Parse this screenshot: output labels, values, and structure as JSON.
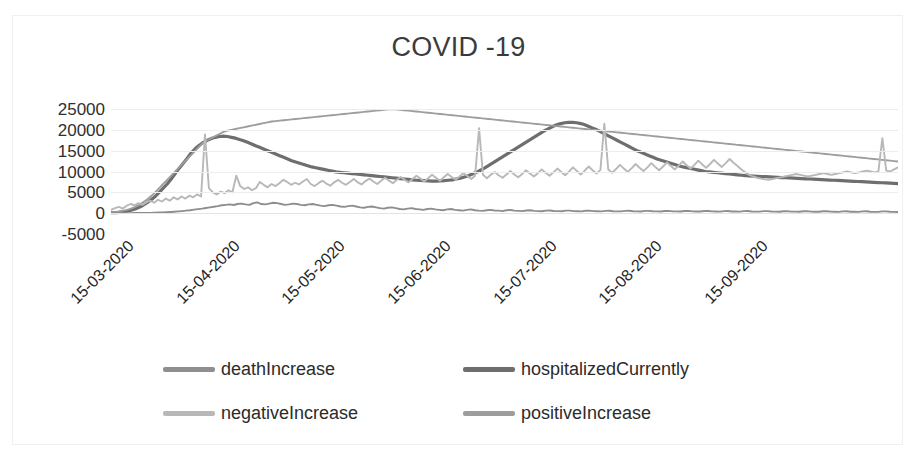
{
  "chart_data": {
    "type": "line",
    "title": "COVID -19",
    "xlabel": "",
    "ylabel": "",
    "ylim": [
      -5000,
      25000
    ],
    "yticks": [
      25000,
      20000,
      15000,
      10000,
      5000,
      0,
      -5000
    ],
    "ytick_labels": [
      "25000",
      "20000",
      "15000",
      "10000",
      "5000",
      "0",
      "-5000"
    ],
    "grid": true,
    "legend_position": "bottom",
    "xtick_labels": [
      "15-03-2020",
      "15-04-2020",
      "15-05-2020",
      "15-06-2020",
      "15-07-2020",
      "15-08-2020",
      "15-09-2020"
    ],
    "x_start": "15-03-2020",
    "x_end": "25-09-2020",
    "series": [
      {
        "name": "deathIncrease",
        "color": "#8e8e8e",
        "values": [
          0,
          0,
          5,
          8,
          10,
          20,
          25,
          30,
          45,
          60,
          80,
          110,
          150,
          180,
          220,
          280,
          340,
          420,
          500,
          600,
          700,
          850,
          980,
          1100,
          1250,
          1400,
          1550,
          1700,
          1900,
          2000,
          2100,
          1950,
          2200,
          2300,
          2100,
          2000,
          2400,
          2600,
          2200,
          2100,
          2300,
          2500,
          2400,
          2200,
          2000,
          2100,
          2300,
          2200,
          2000,
          1900,
          2100,
          2200,
          2000,
          1800,
          1700,
          1900,
          2000,
          1800,
          1600,
          1500,
          1700,
          1800,
          1600,
          1400,
          1300,
          1500,
          1600,
          1400,
          1200,
          1100,
          1300,
          1400,
          1200,
          1000,
          900,
          1100,
          1200,
          1000,
          900,
          800,
          1000,
          1100,
          900,
          800,
          700,
          900,
          1000,
          800,
          700,
          600,
          800,
          900,
          700,
          600,
          550,
          700,
          800,
          650,
          600,
          500,
          700,
          750,
          600,
          550,
          500,
          650,
          700,
          550,
          500,
          450,
          600,
          650,
          520,
          480,
          450,
          600,
          620,
          500,
          470,
          440,
          580,
          600,
          480,
          450,
          430,
          560,
          580,
          470,
          440,
          420,
          550,
          570,
          460,
          430,
          410,
          540,
          560,
          450,
          420,
          400,
          530,
          550,
          440,
          420,
          400,
          520,
          540,
          430,
          410,
          390,
          510,
          530,
          420,
          400,
          380,
          500,
          520,
          410,
          390,
          370,
          490,
          510,
          400,
          380,
          360,
          480,
          500,
          390,
          370,
          350,
          470,
          490,
          380,
          360,
          340,
          460,
          480,
          370,
          350,
          330,
          450,
          470,
          360,
          340,
          320,
          440,
          460,
          350,
          330,
          310,
          430,
          450,
          340,
          320,
          300,
          420,
          440,
          330,
          310,
          290
        ]
      },
      {
        "name": "hospitalizedCurrently",
        "color": "#6e6e6e",
        "values": [
          100,
          150,
          200,
          300,
          450,
          700,
          1000,
          1400,
          1900,
          2500,
          3200,
          4000,
          5000,
          6000,
          7000,
          8200,
          9500,
          10800,
          12000,
          13200,
          14500,
          15500,
          16300,
          17000,
          17500,
          17900,
          18200,
          18400,
          18500,
          18400,
          18200,
          18000,
          17700,
          17400,
          17000,
          16600,
          16200,
          15800,
          15400,
          15000,
          14600,
          14200,
          13800,
          13400,
          13000,
          12600,
          12300,
          12000,
          11700,
          11400,
          11100,
          10900,
          10700,
          10500,
          10300,
          10100,
          9900,
          9800,
          9700,
          9600,
          9500,
          9400,
          9300,
          9200,
          9100,
          9000,
          8900,
          8800,
          8700,
          8600,
          8500,
          8400,
          8300,
          8200,
          8100,
          8000,
          7900,
          7850,
          7800,
          7750,
          7700,
          7700,
          7750,
          7800,
          7900,
          8000,
          8200,
          8400,
          8700,
          9000,
          9400,
          9800,
          10300,
          10800,
          11400,
          12000,
          12600,
          13200,
          13800,
          14400,
          15000,
          15600,
          16200,
          16800,
          17400,
          18000,
          18600,
          19200,
          19800,
          20300,
          20800,
          21200,
          21500,
          21700,
          21800,
          21800,
          21700,
          21500,
          21200,
          20800,
          20400,
          20000,
          19500,
          19000,
          18500,
          18000,
          17500,
          17000,
          16500,
          16000,
          15500,
          15000,
          14600,
          14200,
          13800,
          13400,
          13000,
          12700,
          12400,
          12100,
          11800,
          11500,
          11200,
          11000,
          10800,
          10600,
          10400,
          10200,
          10000,
          9900,
          9800,
          9700,
          9600,
          9500,
          9400,
          9300,
          9200,
          9100,
          9000,
          8950,
          8900,
          8850,
          8800,
          8750,
          8700,
          8650,
          8600,
          8550,
          8500,
          8450,
          8400,
          8350,
          8300,
          8250,
          8200,
          8150,
          8100,
          8050,
          8000,
          7950,
          7900,
          7850,
          7800,
          7750,
          7700,
          7650,
          7600,
          7550,
          7500,
          7450,
          7400,
          7350,
          7300,
          7250,
          7200,
          7150,
          7100
        ]
      },
      {
        "name": "negativeIncrease",
        "color": "#b8b8b8",
        "values": [
          800,
          1200,
          1500,
          1100,
          1800,
          2200,
          1900,
          2400,
          2000,
          2600,
          3000,
          2500,
          3200,
          2800,
          3500,
          3000,
          3800,
          3300,
          4000,
          3500,
          4200,
          3800,
          4500,
          4000,
          18900,
          6000,
          5000,
          4500,
          5200,
          4800,
          5500,
          5000,
          9000,
          6500,
          5800,
          6200,
          5500,
          6000,
          7500,
          6800,
          6200,
          7000,
          6500,
          7200,
          8000,
          7500,
          6800,
          7300,
          6900,
          7600,
          8200,
          7000,
          6500,
          7200,
          7800,
          7100,
          6600,
          7400,
          8000,
          7300,
          6800,
          7500,
          8200,
          7400,
          6900,
          7700,
          8300,
          7600,
          7000,
          7800,
          8500,
          7800,
          7200,
          8000,
          8700,
          8000,
          7400,
          8200,
          9000,
          8300,
          7600,
          8400,
          9200,
          8500,
          7800,
          8600,
          9400,
          8700,
          8000,
          8800,
          9600,
          8900,
          8200,
          9000,
          20400,
          9200,
          8400,
          9200,
          9900,
          9100,
          8500,
          9300,
          10100,
          9300,
          8600,
          9400,
          10300,
          9500,
          8800,
          9600,
          10500,
          9700,
          9000,
          9800,
          10700,
          9900,
          9100,
          10000,
          11000,
          10100,
          9300,
          10200,
          11200,
          10300,
          9500,
          10400,
          21500,
          10500,
          9700,
          10600,
          11600,
          10700,
          9900,
          10800,
          11800,
          10900,
          10100,
          11000,
          12000,
          11100,
          10300,
          11200,
          12200,
          11300,
          10500,
          11400,
          12400,
          11500,
          10700,
          11600,
          12600,
          11700,
          10900,
          11800,
          12800,
          11900,
          11100,
          12000,
          13000,
          12100,
          11300,
          10500,
          9800,
          9200,
          8800,
          8500,
          8300,
          8100,
          8000,
          8200,
          8400,
          8600,
          8800,
          9000,
          9200,
          9400,
          9200,
          9000,
          8800,
          9000,
          9200,
          9400,
          9600,
          9400,
          9200,
          9400,
          9600,
          9800,
          10000,
          9800,
          9600,
          9800,
          10000,
          10200,
          10000,
          9800,
          10000,
          18000,
          10200,
          10000,
          10500,
          11000
        ]
      },
      {
        "name": "positiveIncrease",
        "color": "#9d9d9d",
        "values": [
          200,
          300,
          400,
          600,
          800,
          1100,
          1500,
          2000,
          2600,
          3300,
          4100,
          5000,
          6000,
          7000,
          8000,
          9000,
          10000,
          11000,
          12000,
          13000,
          14000,
          15000,
          16000,
          17000,
          17500,
          18000,
          18500,
          19000,
          19500,
          19800,
          20000,
          20200,
          20400,
          20600,
          20800,
          21000,
          21200,
          21400,
          21600,
          21800,
          22000,
          22100,
          22200,
          22300,
          22400,
          22500,
          22600,
          22700,
          22800,
          22900,
          23000,
          23100,
          23200,
          23300,
          23400,
          23500,
          23600,
          23700,
          23800,
          23900,
          24000,
          24100,
          24200,
          24300,
          24400,
          24500,
          24600,
          24700,
          24800,
          24900,
          25000,
          24900,
          24800,
          24700,
          24600,
          24500,
          24400,
          24300,
          24200,
          24100,
          24000,
          23900,
          23800,
          23700,
          23600,
          23500,
          23400,
          23300,
          23200,
          23100,
          23000,
          22900,
          22800,
          22700,
          22600,
          22500,
          22400,
          22300,
          22200,
          22100,
          22000,
          21900,
          21800,
          21700,
          21600,
          21500,
          21400,
          21300,
          21200,
          21100,
          21000,
          20900,
          20800,
          20700,
          20600,
          20500,
          20400,
          20300,
          20200,
          20100,
          20000,
          19900,
          19800,
          19700,
          19600,
          19500,
          19400,
          19300,
          19200,
          19100,
          19000,
          18900,
          18800,
          18700,
          18600,
          18500,
          18400,
          18300,
          18200,
          18100,
          18000,
          17900,
          17800,
          17700,
          17600,
          17500,
          17400,
          17300,
          17200,
          17100,
          17000,
          16900,
          16800,
          16700,
          16600,
          16500,
          16400,
          16300,
          16200,
          16100,
          16000,
          15900,
          15800,
          15700,
          15600,
          15500,
          15400,
          15300,
          15200,
          15100,
          15000,
          14900,
          14800,
          14700,
          14600,
          14500,
          14400,
          14300,
          14200,
          14100,
          14000,
          13900,
          13800,
          13700,
          13600,
          13500,
          13400,
          13300,
          13200,
          13100,
          13000,
          12900,
          12800,
          12700,
          12600,
          12500,
          12400
        ]
      }
    ]
  },
  "legend": {
    "items": [
      {
        "label": "deathIncrease",
        "color": "#8e8e8e"
      },
      {
        "label": "hospitalizedCurrently",
        "color": "#6e6e6e"
      },
      {
        "label": "negativeIncrease",
        "color": "#b8b8b8"
      },
      {
        "label": "positiveIncrease",
        "color": "#9d9d9d"
      }
    ]
  }
}
